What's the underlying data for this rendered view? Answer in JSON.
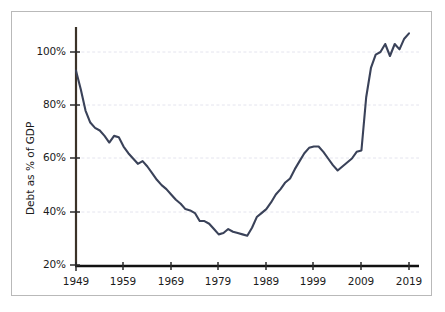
{
  "chart_data": {
    "type": "line",
    "title": "",
    "subtitle": "",
    "xlabel": "",
    "ylabel": "Debt as % of GDP",
    "xlim": [
      1949,
      2019
    ],
    "ylim": [
      20,
      108
    ],
    "grid": "horizontal-dashed",
    "legend": "none",
    "series_name": "Federal debt held by the public as a percentage of GDP",
    "line_color": "#3a4259",
    "y_tick_labels": [
      "20%",
      "40%",
      "60%",
      "80%",
      "100%"
    ],
    "y_tick_values": [
      20,
      40,
      60,
      80,
      100
    ],
    "x_tick_labels": [
      "1949",
      "1959",
      "1969",
      "1979",
      "1989",
      "1999",
      "2009",
      "2019"
    ],
    "x_tick_values": [
      1949,
      1959,
      1969,
      1979,
      1989,
      1999,
      2009,
      2019
    ],
    "x": [
      1949,
      1950,
      1951,
      1952,
      1953,
      1954,
      1955,
      1956,
      1957,
      1958,
      1959,
      1960,
      1961,
      1962,
      1963,
      1964,
      1965,
      1966,
      1967,
      1968,
      1969,
      1970,
      1971,
      1972,
      1973,
      1974,
      1975,
      1976,
      1977,
      1978,
      1979,
      1980,
      1981,
      1982,
      1983,
      1984,
      1985,
      1986,
      1987,
      1988,
      1989,
      1990,
      1991,
      1992,
      1993,
      1994,
      1995,
      1996,
      1997,
      1998,
      1999,
      2000,
      2001,
      2002,
      2003,
      2004,
      2005,
      2006,
      2007,
      2008,
      2009,
      2010,
      2011,
      2012,
      2013,
      2014,
      2015,
      2016,
      2017,
      2018,
      2019
    ],
    "values": [
      93.0,
      86.0,
      78.0,
      73.5,
      71.5,
      70.5,
      68.5,
      66.0,
      68.5,
      68.0,
      64.5,
      62.0,
      60.0,
      58.0,
      59.0,
      57.0,
      54.5,
      52.0,
      50.0,
      48.5,
      46.5,
      44.5,
      43.0,
      41.0,
      40.5,
      39.5,
      36.5,
      36.5,
      35.5,
      33.5,
      31.5,
      32.0,
      33.5,
      32.5,
      32.0,
      31.5,
      31.0,
      34.0,
      38.0,
      39.5,
      41.0,
      43.5,
      46.5,
      48.5,
      51.0,
      52.5,
      56.0,
      59.0,
      62.0,
      64.0,
      64.5,
      64.5,
      62.5,
      60.0,
      57.5,
      55.5,
      57.0,
      58.5,
      60.0,
      62.5,
      63.0,
      83.0,
      94.0,
      99.0,
      100.0,
      103.0,
      98.5,
      103.0,
      101.0,
      105.0,
      107.0
    ]
  },
  "axis": {
    "y_label": "Debt as % of GDP",
    "y_ticks": [
      "100%",
      "80%",
      "60%",
      "40%",
      "20%"
    ],
    "x_ticks": [
      "1949",
      "1959",
      "1969",
      "1979",
      "1989",
      "1999",
      "2009",
      "2019"
    ]
  }
}
